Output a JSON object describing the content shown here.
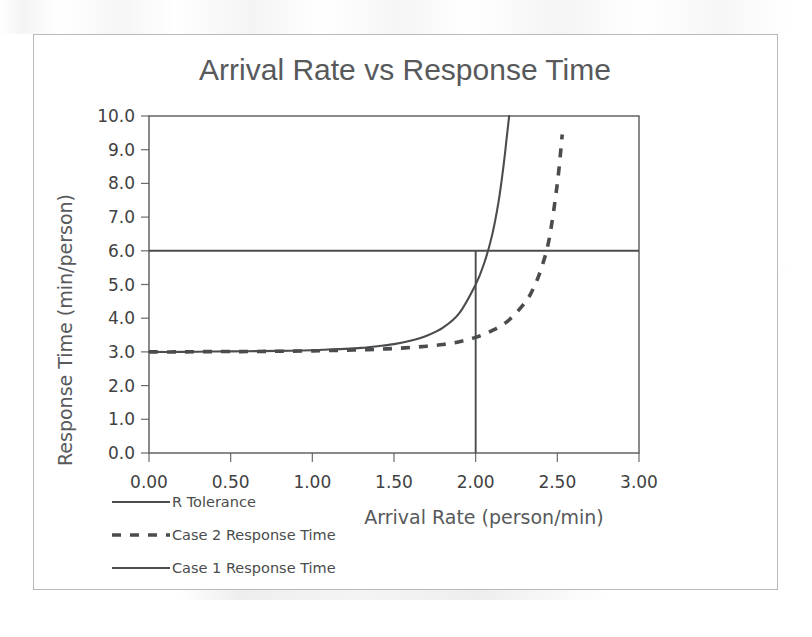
{
  "figure": {
    "title": "Arrival Rate vs Response Time"
  },
  "chart_data": {
    "type": "line",
    "title": "Arrival Rate vs Response Time",
    "xlabel": "Arrival Rate (person/min)",
    "ylabel": "Response Time (min/person)",
    "xlim": [
      0.0,
      3.0
    ],
    "ylim": [
      0.0,
      10.0
    ],
    "xticks": [
      0.0,
      0.5,
      1.0,
      1.5,
      2.0,
      2.5,
      3.0
    ],
    "xtick_labels": [
      "0.00",
      "0.50",
      "1.00",
      "1.50",
      "2.00",
      "2.50",
      "3.00"
    ],
    "yticks": [
      0.0,
      1.0,
      2.0,
      3.0,
      4.0,
      5.0,
      6.0,
      7.0,
      8.0,
      9.0,
      10.0
    ],
    "ytick_labels": [
      "0.0",
      "1.0",
      "2.0",
      "3.0",
      "4.0",
      "5.0",
      "6.0",
      "7.0",
      "8.0",
      "9.0",
      "10.0"
    ],
    "grid": false,
    "legend_position": "bottom-left",
    "series": [
      {
        "name": "R Tolerance",
        "style": "solid",
        "color": "#4a4c4e",
        "kind": "horizontal-reference",
        "value": 6.0,
        "x": [
          0.0,
          3.0
        ],
        "values": [
          6.0,
          6.0
        ]
      },
      {
        "name": "Case 2 Response Time",
        "style": "dashed",
        "color": "#4a4c4e",
        "kind": "curve",
        "asymptote_x": 2.58,
        "baseline_y": 3.0,
        "x": [
          0.0,
          0.2,
          0.4,
          0.6,
          0.8,
          1.0,
          1.1,
          1.2,
          1.3,
          1.4,
          1.5,
          1.6,
          1.7,
          1.8,
          1.9,
          2.0,
          2.1,
          2.2,
          2.3,
          2.35,
          2.4,
          2.45,
          2.5,
          2.53
        ],
        "values": [
          3.0,
          3.0,
          3.01,
          3.01,
          3.02,
          3.03,
          3.04,
          3.05,
          3.06,
          3.08,
          3.1,
          3.13,
          3.17,
          3.22,
          3.3,
          3.43,
          3.63,
          3.93,
          4.45,
          4.85,
          5.45,
          6.35,
          8.0,
          9.45
        ]
      },
      {
        "name": "Case 1 Response Time",
        "style": "solid",
        "color": "#4a4c4e",
        "kind": "curve",
        "asymptote_x": 2.24,
        "baseline_y": 3.0,
        "x": [
          0.0,
          0.2,
          0.4,
          0.6,
          0.8,
          1.0,
          1.1,
          1.2,
          1.3,
          1.4,
          1.5,
          1.6,
          1.7,
          1.8,
          1.9,
          2.0,
          2.05,
          2.1,
          2.14,
          2.17,
          2.19,
          2.205
        ],
        "values": [
          3.0,
          3.0,
          3.01,
          3.02,
          3.03,
          3.05,
          3.07,
          3.09,
          3.12,
          3.17,
          3.23,
          3.33,
          3.48,
          3.72,
          4.15,
          5.0,
          5.6,
          6.45,
          7.45,
          8.5,
          9.35,
          10.0
        ]
      },
      {
        "name": "Operating point marker",
        "style": "solid",
        "color": "#4a4c4e",
        "kind": "vertical-reference",
        "value": 2.0,
        "x": [
          2.0,
          2.0
        ],
        "values": [
          0.0,
          6.0
        ]
      }
    ],
    "annotations": [
      {
        "text": "R Tolerance level",
        "y": 6.0
      },
      {
        "text": "Design arrival rate",
        "x": 2.0
      }
    ]
  },
  "legend": {
    "items": [
      {
        "label": "R Tolerance",
        "style": "solid"
      },
      {
        "label": "Case 2 Response Time",
        "style": "dashed"
      },
      {
        "label": "Case 1 Response Time",
        "style": "solid"
      }
    ]
  }
}
